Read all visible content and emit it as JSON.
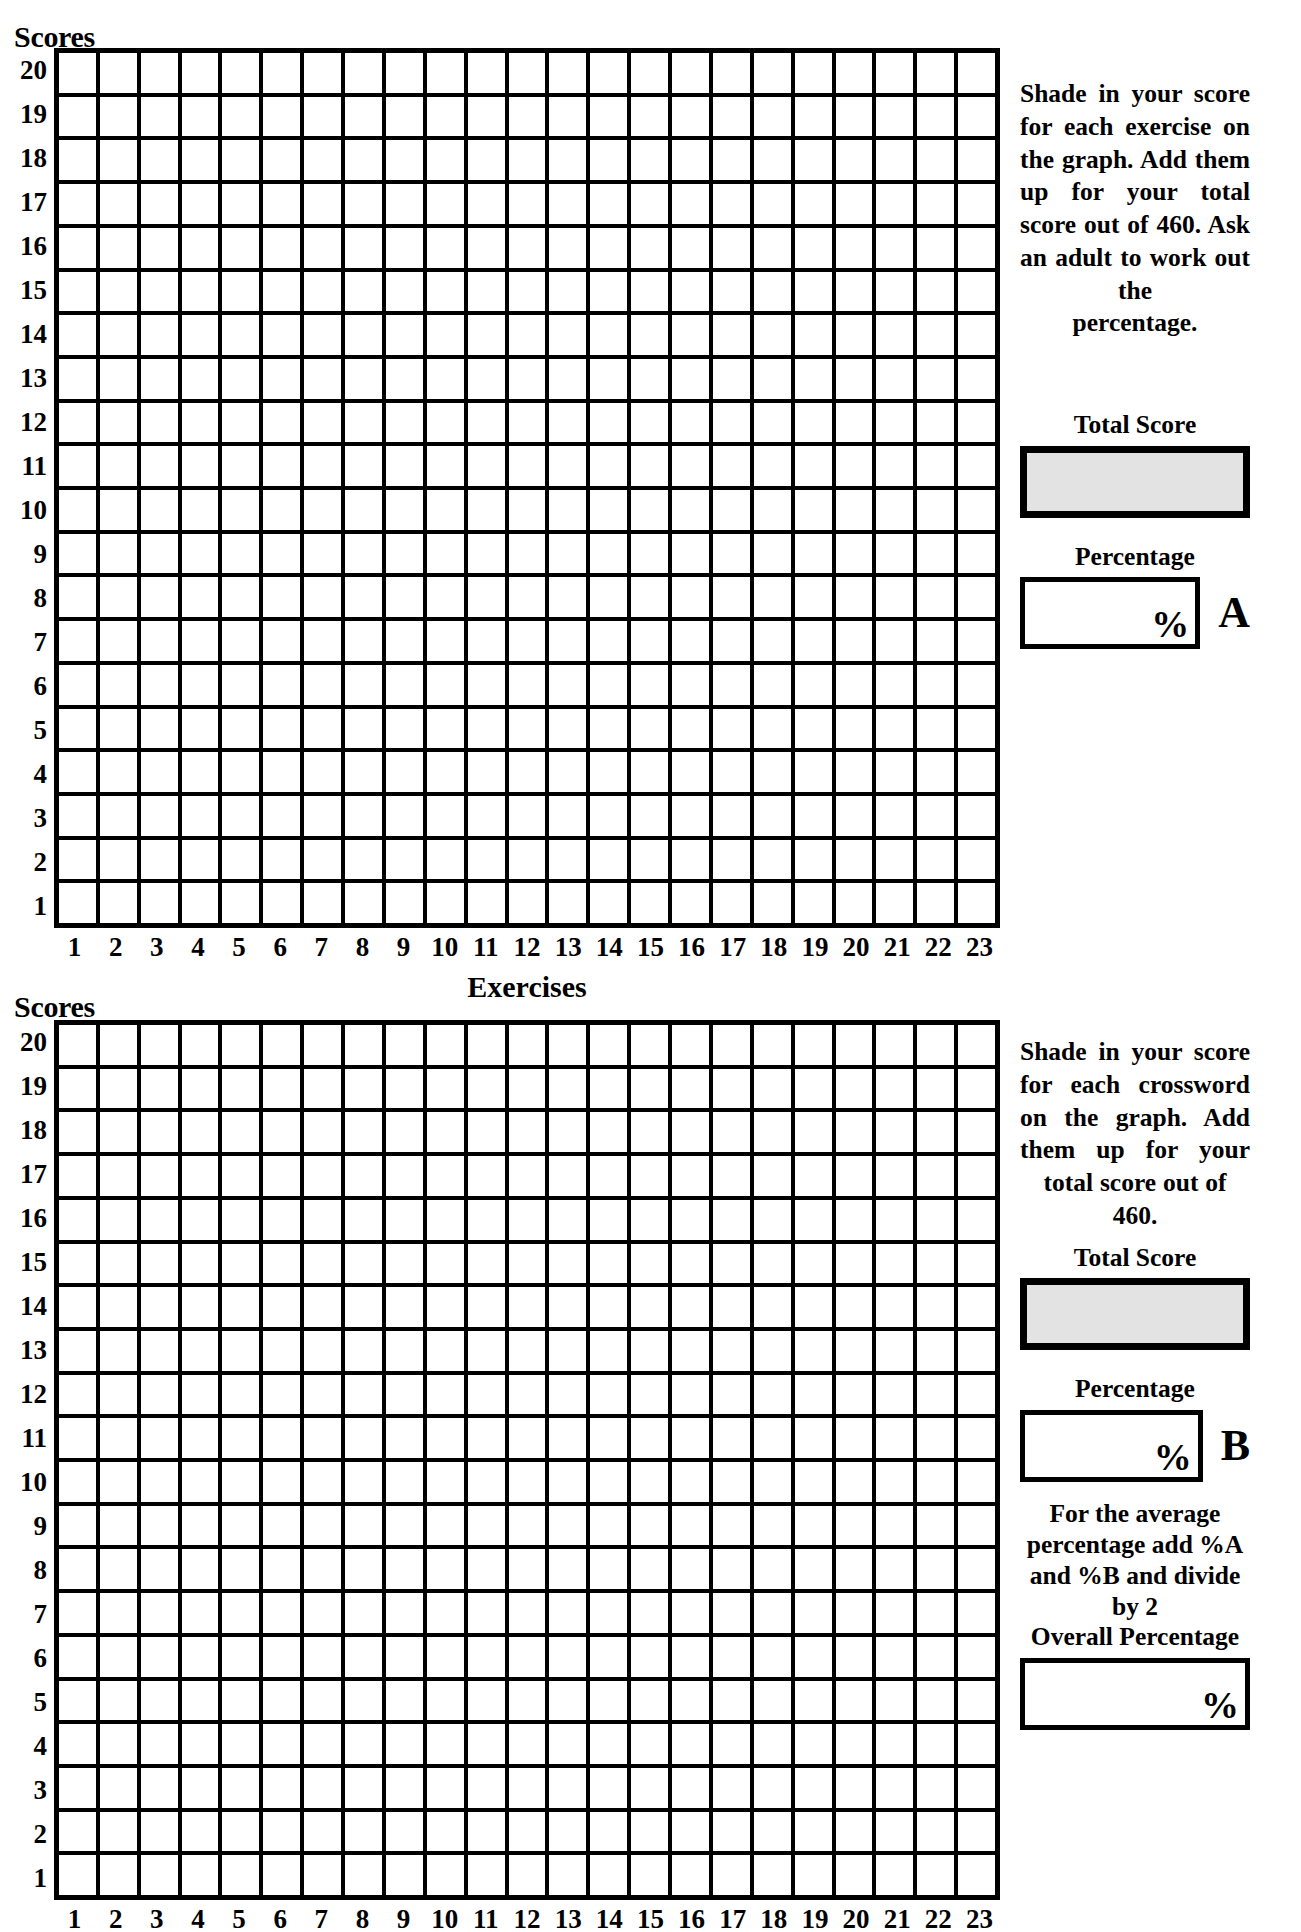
{
  "worksheet": {
    "y_axis_title": "Scores",
    "x_axis_title": "Exercises",
    "y_ticks": [
      "20",
      "19",
      "18",
      "17",
      "16",
      "15",
      "14",
      "13",
      "12",
      "11",
      "10",
      "9",
      "8",
      "7",
      "6",
      "5",
      "4",
      "3",
      "2",
      "1"
    ],
    "x_ticks": [
      "1",
      "2",
      "3",
      "4",
      "5",
      "6",
      "7",
      "8",
      "9",
      "10",
      "11",
      "12",
      "13",
      "14",
      "15",
      "16",
      "17",
      "18",
      "19",
      "20",
      "21",
      "22",
      "23"
    ],
    "total_score_label": "Total Score",
    "percentage_label": "Percentage",
    "percent_sign": "%",
    "grid_color": "#000000",
    "score_box_fill": "#e3e3e3"
  },
  "panel_a": {
    "instructions": "Shade in your score for each exercise on the graph. Add them up for your total score out of 460. Ask an adult to work out the",
    "instructions_last_line": "percentage.",
    "marker": "A"
  },
  "panel_b": {
    "instructions": "Shade in your score for each crossword on the graph. Add them up for your total score out of",
    "instructions_last_line": "460.",
    "marker": "B",
    "average_note": "For the average percentage add %A and %B and divide by 2",
    "overall_label": "Overall Percentage"
  },
  "chart_data": {
    "type": "bar",
    "title": "Scores",
    "xlabel": "Exercises",
    "ylabel": "Scores",
    "categories": [
      "1",
      "2",
      "3",
      "4",
      "5",
      "6",
      "7",
      "8",
      "9",
      "10",
      "11",
      "12",
      "13",
      "14",
      "15",
      "16",
      "17",
      "18",
      "19",
      "20",
      "21",
      "22",
      "23"
    ],
    "ylim": [
      0,
      20
    ],
    "grid": true,
    "legend": "none",
    "series": [
      {
        "name": "A",
        "values": [
          0,
          0,
          0,
          0,
          0,
          0,
          0,
          0,
          0,
          0,
          0,
          0,
          0,
          0,
          0,
          0,
          0,
          0,
          0,
          0,
          0,
          0,
          0
        ]
      },
      {
        "name": "B",
        "values": [
          0,
          0,
          0,
          0,
          0,
          0,
          0,
          0,
          0,
          0,
          0,
          0,
          0,
          0,
          0,
          0,
          0,
          0,
          0,
          0,
          0,
          0,
          0
        ]
      }
    ],
    "max_total": 460,
    "note": "Blank shading grid: 23 exercise columns x 20 score rows per panel; no bars filled."
  }
}
